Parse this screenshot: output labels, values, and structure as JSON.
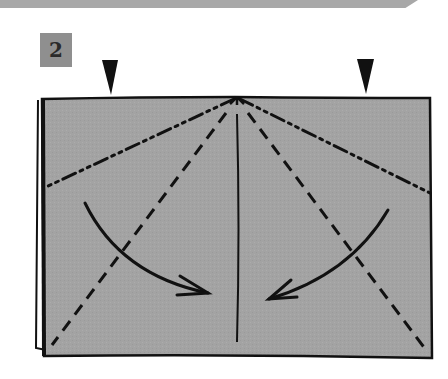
{
  "step": {
    "number": "2",
    "badge_color": "#8f8f8f"
  },
  "diagram": {
    "paper_color": "#a3a3a3",
    "line_color": "#111111",
    "markers": [
      {
        "type": "pinch-arrow-down",
        "x": 110
      },
      {
        "type": "pinch-arrow-down",
        "x": 364
      }
    ],
    "lines": [
      {
        "type": "mountain-fold",
        "from": "top-center",
        "to": "left-edge"
      },
      {
        "type": "mountain-fold",
        "from": "top-center",
        "to": "right-edge"
      },
      {
        "type": "valley-fold",
        "from": "top-center",
        "to": "bottom-left-corner"
      },
      {
        "type": "valley-fold",
        "from": "top-center",
        "to": "bottom-right-corner"
      },
      {
        "type": "center-crease",
        "from": "top-center",
        "to": "bottom-center"
      }
    ],
    "arrows": [
      {
        "direction": "fold-right-inward",
        "side": "left"
      },
      {
        "direction": "fold-left-inward",
        "side": "right"
      }
    ]
  }
}
